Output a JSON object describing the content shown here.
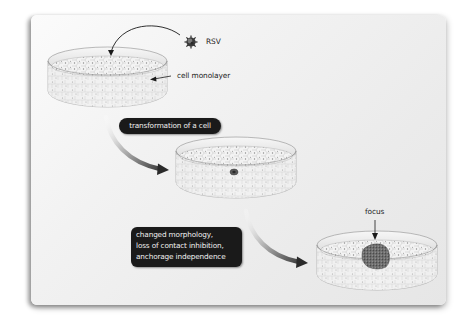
{
  "diagram": {
    "type": "process-flow",
    "labels": {
      "virus": "RSV",
      "cell_layer": "cell monolayer",
      "focus": "focus"
    },
    "steps": [
      {
        "label": "transformation of a cell"
      },
      {
        "lines": [
          "changed morphology,",
          "loss of contact inhibition,",
          "anchorage independence"
        ]
      }
    ],
    "colors": {
      "card_bg": "#efefef",
      "pill_bg": "#1a1a1a",
      "pill_text": "#f0f0f0",
      "arrow_dark": "#333333",
      "arrow_light": "#e0e0e0",
      "dish_rim": "#dcdcdc",
      "cell_fill": "#f4f4f4",
      "focus_fill": "#6e6e6e"
    },
    "dishes": [
      {
        "name": "dish-initial",
        "state": "normal monolayer"
      },
      {
        "name": "dish-transformed",
        "state": "single transformed cell"
      },
      {
        "name": "dish-focus",
        "state": "focus of transformed cells"
      }
    ]
  }
}
